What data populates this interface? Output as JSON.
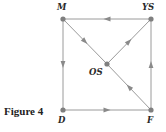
{
  "figure": {
    "caption": "Figure 4"
  },
  "colors": {
    "edge": "#9a9a9a",
    "node": "#7f7f7f",
    "arrow": "#8a8a8a",
    "label": "#2a2a2a"
  },
  "nodes": [
    {
      "id": "M",
      "label": "M",
      "x": 63,
      "y": 19
    },
    {
      "id": "YS",
      "label": "YS",
      "x": 151,
      "y": 19
    },
    {
      "id": "OS",
      "label": "OS",
      "x": 107,
      "y": 64
    },
    {
      "id": "D",
      "label": "D",
      "x": 63,
      "y": 110
    },
    {
      "id": "F",
      "label": "F",
      "x": 151,
      "y": 110
    }
  ],
  "edges": [
    {
      "from": "YS",
      "to": "M"
    },
    {
      "from": "M",
      "to": "OS"
    },
    {
      "from": "OS",
      "to": "YS"
    },
    {
      "from": "F",
      "to": "OS"
    },
    {
      "from": "M",
      "to": "D"
    },
    {
      "from": "D",
      "to": "F"
    },
    {
      "from": "F",
      "to": "YS"
    }
  ]
}
